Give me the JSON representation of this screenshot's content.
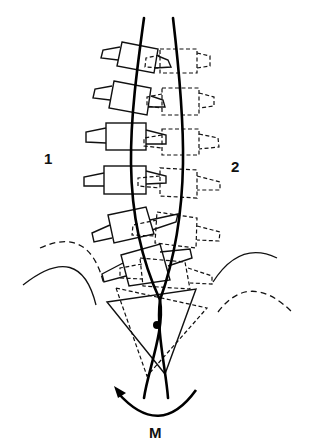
{
  "diagram": {
    "labels": {
      "left_config": "1",
      "right_config": "2",
      "moment": "M"
    },
    "legend": [
      {
        "key": "solid-outline",
        "meaning": "configuration 1"
      },
      {
        "key": "dashed-outline",
        "meaning": "configuration 2"
      }
    ],
    "colors": {
      "ink": "#111111",
      "background": "#ffffff"
    },
    "vertebrae_count": 6,
    "pivot_point": {
      "x": 157,
      "y": 325
    }
  }
}
